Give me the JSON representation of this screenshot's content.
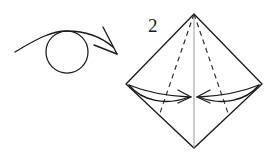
{
  "figure": {
    "kind": "origami-instruction-diagram",
    "step_number": "2",
    "background_color": "#ffffff",
    "ink_color": "#1a1a1a",
    "fold_line_color": "#2a2a2a",
    "center_line_color": "#9a9a9a",
    "elements": {
      "turn_over_symbol": {
        "label": "turn-over-loop-arrow",
        "circle_center_x": 67,
        "circle_center_y": 52,
        "circle_radius": 21,
        "arrow_start_x": 15,
        "arrow_start_y": 51,
        "arrow_tip_x": 117,
        "arrow_tip_y": 53
      },
      "kite_shape": {
        "label": "paper-outline-diamond",
        "top_x": 194,
        "top_y": 14,
        "left_x": 126,
        "left_y": 84,
        "right_x": 262,
        "right_y": 84,
        "bottom_x": 194,
        "bottom_y": 148
      },
      "center_line": {
        "label": "vertical-center-crease",
        "x": 194,
        "y_top": 14,
        "y_bottom": 148
      },
      "crease_left": {
        "label": "dashed-valley-crease-left",
        "from_x": 194,
        "from_y": 14,
        "to_x": 159,
        "to_y": 116
      },
      "crease_right": {
        "label": "dashed-valley-crease-right",
        "from_x": 194,
        "from_y": 14,
        "to_x": 229,
        "to_y": 116
      },
      "fold_arrow_left": {
        "label": "fold-arrow-left-to-center",
        "from_x": 130,
        "from_y": 86,
        "to_x": 190,
        "to_y": 97
      },
      "fold_arrow_right": {
        "label": "fold-arrow-right-to-center",
        "from_x": 258,
        "from_y": 86,
        "to_x": 198,
        "to_y": 97
      }
    },
    "step_label_position": {
      "x": 148,
      "y": 32
    }
  }
}
